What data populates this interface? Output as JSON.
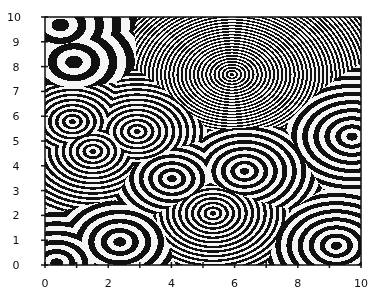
{
  "chart_data": {
    "type": "contour",
    "title": "",
    "xlabel": "",
    "ylabel": "",
    "xlim": [
      0,
      10
    ],
    "ylim": [
      0,
      10
    ],
    "grid": false,
    "legend": null,
    "x_tick_labels": [
      "0",
      "2",
      "4",
      "6",
      "8",
      "10"
    ],
    "x_minor_ticks": [
      0,
      1,
      2,
      3,
      4,
      5,
      6,
      7,
      8,
      9,
      10
    ],
    "y_tick_labels": [
      "0",
      "1",
      "2",
      "3",
      "4",
      "5",
      "6",
      "7",
      "8",
      "9",
      "10"
    ],
    "sources": [
      {
        "x": 0.47,
        "y": 9.7,
        "ring_spacing": 0.55
      },
      {
        "x": 0.9,
        "y": 8.2,
        "ring_spacing": 0.55
      },
      {
        "x": 5.9,
        "y": 7.7,
        "ring_spacing": 0.13
      },
      {
        "x": 0.85,
        "y": 5.8,
        "ring_spacing": 0.22
      },
      {
        "x": 2.9,
        "y": 5.4,
        "ring_spacing": 0.22
      },
      {
        "x": 1.5,
        "y": 4.6,
        "ring_spacing": 0.22
      },
      {
        "x": 9.7,
        "y": 5.2,
        "ring_spacing": 0.35
      },
      {
        "x": 6.3,
        "y": 3.8,
        "ring_spacing": 0.3
      },
      {
        "x": 4.0,
        "y": 3.5,
        "ring_spacing": 0.3
      },
      {
        "x": 5.3,
        "y": 2.1,
        "ring_spacing": 0.2
      },
      {
        "x": 2.35,
        "y": 0.95,
        "ring_spacing": 0.4
      },
      {
        "x": 9.2,
        "y": 0.8,
        "ring_spacing": 0.35
      },
      {
        "x": 0.35,
        "y": 0.1,
        "ring_spacing": 0.4
      }
    ]
  },
  "colors": {
    "ink": "#111111",
    "paper": "#ffffff"
  }
}
